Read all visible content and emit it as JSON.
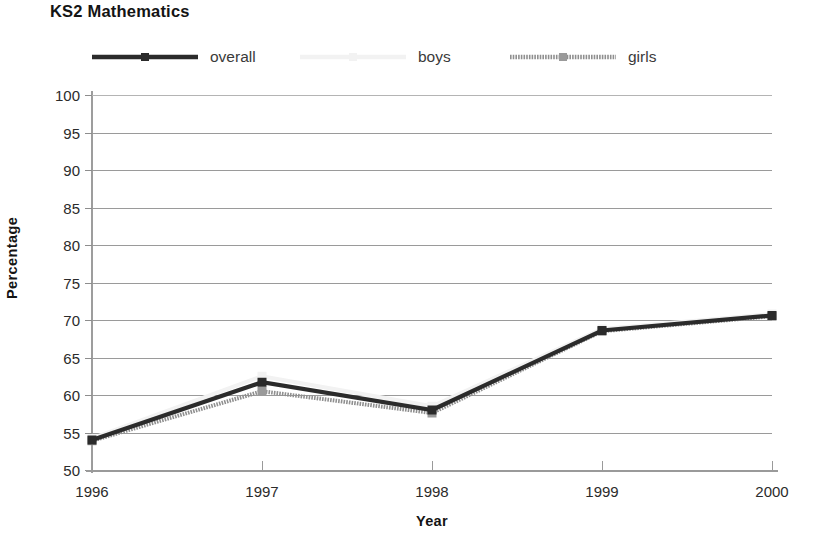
{
  "chart_data": {
    "type": "line",
    "title": "KS2 Mathematics",
    "xlabel": "Year",
    "ylabel": "Percentage",
    "categories": [
      "1996",
      "1997",
      "1998",
      "1999",
      "2000"
    ],
    "x": [
      1996,
      1997,
      1998,
      1999,
      2000
    ],
    "xlim": [
      1996,
      2000
    ],
    "ylim": [
      50,
      100
    ],
    "yticks": [
      50,
      55,
      60,
      65,
      70,
      75,
      80,
      85,
      90,
      95,
      100
    ],
    "grid": "horizontal",
    "legend_position": "top",
    "series": [
      {
        "name": "overall",
        "color": "#2b2b2b",
        "marker": "square",
        "values": [
          54.0,
          61.7,
          58.0,
          68.6,
          70.6
        ]
      },
      {
        "name": "boys",
        "color": "#f2f2f2",
        "marker": "square",
        "values": [
          54.2,
          62.5,
          58.5,
          68.8,
          70.8
        ]
      },
      {
        "name": "girls",
        "color": "#8f8f8f",
        "marker": "square",
        "values": [
          53.9,
          60.5,
          57.6,
          68.5,
          70.5
        ]
      }
    ]
  },
  "colors": {
    "overall": "#2b2b2b",
    "boys": "#f2f2f2",
    "girls": "#8f8f8f",
    "grid": "#9a9a9a",
    "axis": "#9a9a9a",
    "text": "#2b2b2b",
    "background": "#ffffff"
  },
  "legend": {
    "items": [
      {
        "label": "overall",
        "key": "overall"
      },
      {
        "label": "boys",
        "key": "boys"
      },
      {
        "label": "girls",
        "key": "girls"
      }
    ]
  }
}
